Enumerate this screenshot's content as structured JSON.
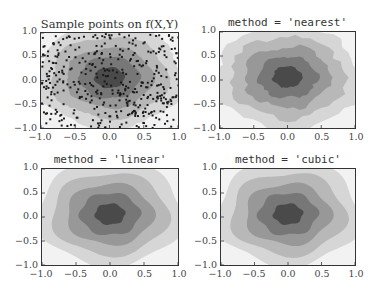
{
  "chart_data": [
    {
      "type": "scatter",
      "title": "Sample points on f(X,Y)",
      "description": "Filled contour of f(X,Y) with scattered sample points overlaid",
      "xlim": [
        -1.0,
        1.0
      ],
      "ylim": [
        -1.0,
        1.0
      ],
      "xticks": [
        "−1.0",
        "−0.5",
        "0.0",
        "0.5",
        "1.0"
      ],
      "yticks": [
        "1.0",
        "0.5",
        "0.0",
        "−0.5",
        "−1.0"
      ],
      "xlabel": "",
      "ylabel": "",
      "grid": false,
      "contour_levels": 6,
      "colormap": "gray",
      "point_count_estimate": 1000
    },
    {
      "type": "heatmap",
      "title": "method = 'nearest'",
      "description": "Filled contour of nearest-neighbour interpolated grid",
      "xlim": [
        -1.0,
        1.0
      ],
      "ylim": [
        -1.0,
        1.0
      ],
      "xticks": [
        "−1.0",
        "−0.5",
        "0.0",
        "0.5",
        "1.0"
      ],
      "yticks": [
        "1.0",
        "0.5",
        "0.0",
        "−0.5",
        "−1.0"
      ],
      "xlabel": "",
      "ylabel": "",
      "grid": false,
      "contour_levels": 6,
      "colormap": "gray"
    },
    {
      "type": "heatmap",
      "title": "method = 'linear'",
      "description": "Filled contour of linearly interpolated grid",
      "xlim": [
        -1.0,
        1.0
      ],
      "ylim": [
        -1.0,
        1.0
      ],
      "xticks": [
        "−1.0",
        "−0.5",
        "0.0",
        "0.5",
        "1.0"
      ],
      "yticks": [
        "1.0",
        "0.5",
        "0.0",
        "−0.5",
        "−1.0"
      ],
      "xlabel": "",
      "ylabel": "",
      "grid": false,
      "contour_levels": 6,
      "colormap": "gray"
    },
    {
      "type": "heatmap",
      "title": "method = 'cubic'",
      "description": "Filled contour of cubic interpolated grid",
      "xlim": [
        -1.0,
        1.0
      ],
      "ylim": [
        -1.0,
        1.0
      ],
      "xticks": [
        "−1.0",
        "−0.5",
        "0.0",
        "0.5",
        "1.0"
      ],
      "yticks": [
        "1.0",
        "0.5",
        "0.0",
        "−0.5",
        "−1.0"
      ],
      "xlabel": "",
      "ylabel": "",
      "grid": false,
      "contour_levels": 6,
      "colormap": "gray"
    }
  ],
  "colors": {
    "level_0": "#f2f2f2",
    "level_1": "#d6d6d6",
    "level_2": "#b8b8b8",
    "level_3": "#989898",
    "level_4": "#777777",
    "level_5": "#4a4a4a",
    "points": "#1a1a1a",
    "axes_border": "#333333"
  }
}
